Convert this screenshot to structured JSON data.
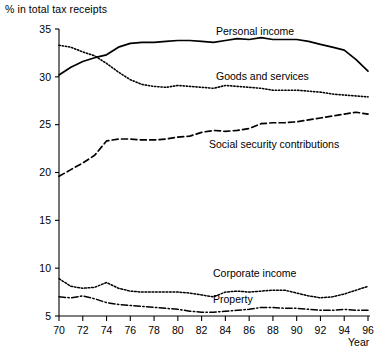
{
  "chart_data": {
    "type": "line",
    "title": "",
    "ylabel": "% in total tax receipts",
    "xlabel": "Year",
    "ylim": [
      5,
      35
    ],
    "xlim": [
      70,
      96
    ],
    "yticks": [
      5,
      10,
      15,
      20,
      25,
      30,
      35
    ],
    "xticks": [
      70,
      72,
      74,
      76,
      78,
      80,
      82,
      84,
      86,
      88,
      90,
      92,
      94,
      96
    ],
    "grid": false,
    "legend_position": "inline-labels",
    "x": [
      70,
      71,
      72,
      73,
      74,
      75,
      76,
      77,
      78,
      79,
      80,
      81,
      82,
      83,
      84,
      85,
      86,
      87,
      88,
      89,
      90,
      91,
      92,
      93,
      94,
      95,
      96
    ],
    "series": [
      {
        "name": "Personal income",
        "linestyle": "solid",
        "values": [
          30.2,
          31.0,
          31.6,
          32.0,
          32.3,
          33.1,
          33.5,
          33.6,
          33.6,
          33.7,
          33.8,
          33.8,
          33.7,
          33.6,
          33.8,
          34.0,
          33.9,
          34.1,
          33.9,
          33.9,
          33.9,
          33.7,
          33.4,
          33.1,
          32.8,
          31.8,
          30.6
        ]
      },
      {
        "name": "Goods and services",
        "linestyle": "dotted",
        "values": [
          33.3,
          33.1,
          32.6,
          32.2,
          31.4,
          30.5,
          29.7,
          29.2,
          29.0,
          28.9,
          29.1,
          29.0,
          28.9,
          28.8,
          29.1,
          29.0,
          28.9,
          28.8,
          28.6,
          28.6,
          28.6,
          28.5,
          28.4,
          28.2,
          28.1,
          28.0,
          27.9
        ]
      },
      {
        "name": "Social security contributions",
        "linestyle": "dashed",
        "values": [
          19.6,
          20.3,
          21.0,
          21.8,
          23.3,
          23.5,
          23.5,
          23.4,
          23.4,
          23.5,
          23.7,
          23.8,
          24.2,
          24.4,
          24.3,
          24.4,
          24.6,
          25.1,
          25.2,
          25.2,
          25.3,
          25.5,
          25.7,
          25.9,
          26.1,
          26.3,
          26.1
        ]
      },
      {
        "name": "Corporate income",
        "linestyle": "dotted-fine",
        "values": [
          8.9,
          8.1,
          7.9,
          8.0,
          8.5,
          7.9,
          7.6,
          7.5,
          7.5,
          7.5,
          7.5,
          7.4,
          7.2,
          7.0,
          7.5,
          7.6,
          7.5,
          7.6,
          7.7,
          7.7,
          7.4,
          7.1,
          6.9,
          7.0,
          7.3,
          7.7,
          8.1
        ]
      },
      {
        "name": "Property",
        "linestyle": "dash-dot",
        "values": [
          7.0,
          6.9,
          7.1,
          6.8,
          6.4,
          6.2,
          6.1,
          6.0,
          5.9,
          5.8,
          5.7,
          5.5,
          5.4,
          5.4,
          5.5,
          5.6,
          5.7,
          5.9,
          5.9,
          5.8,
          5.8,
          5.7,
          5.6,
          5.6,
          5.7,
          5.6,
          5.6
        ]
      }
    ],
    "annotations": [
      {
        "text": "Personal income",
        "x_px": 216,
        "y_px": 35
      },
      {
        "text": "Goods and services",
        "x_px": 216,
        "y_px": 80
      },
      {
        "text": "Social security contributions",
        "x_px": 209,
        "y_px": 148
      },
      {
        "text": "Corporate income",
        "x_px": 213,
        "y_px": 277
      },
      {
        "text": "Property",
        "x_px": 213,
        "y_px": 303
      }
    ]
  }
}
